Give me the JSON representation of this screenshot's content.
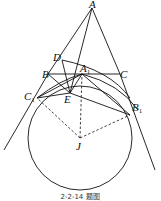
{
  "figure": {
    "caption": "2-2-14 题图",
    "points": [
      {
        "id": "A",
        "label": "A",
        "sub": ""
      },
      {
        "id": "B",
        "label": "B",
        "sub": ""
      },
      {
        "id": "C",
        "label": "C",
        "sub": ""
      },
      {
        "id": "D",
        "label": "D",
        "sub": ""
      },
      {
        "id": "A1",
        "label": "A",
        "sub": "1"
      },
      {
        "id": "E",
        "label": "E",
        "sub": ""
      },
      {
        "id": "C1",
        "label": "C",
        "sub": "1"
      },
      {
        "id": "B1",
        "label": "B",
        "sub": "1"
      },
      {
        "id": "J",
        "label": "J",
        "sub": ""
      }
    ]
  }
}
